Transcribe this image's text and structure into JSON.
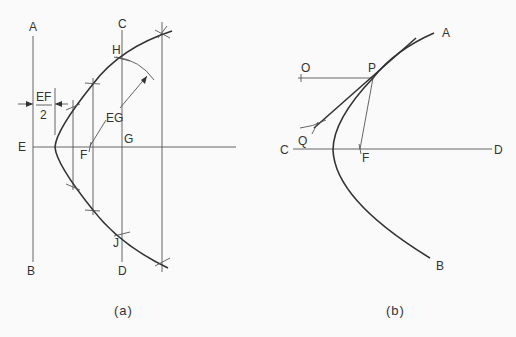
{
  "figure_a": {
    "caption": "(a)",
    "labels": {
      "A": "A",
      "B": "B",
      "C": "C",
      "D": "D",
      "E": "E",
      "F": "F",
      "G": "G",
      "H": "H",
      "J": "J",
      "EG": "EG",
      "EF_num": "EF",
      "EF_den": "2"
    }
  },
  "figure_b": {
    "caption": "(b)",
    "labels": {
      "A": "A",
      "B": "B",
      "C": "C",
      "D": "D",
      "O": "O",
      "P": "P",
      "Q": "Q",
      "F": "F"
    }
  },
  "colors": {
    "ink": "#333333",
    "background": "#fafafa"
  }
}
